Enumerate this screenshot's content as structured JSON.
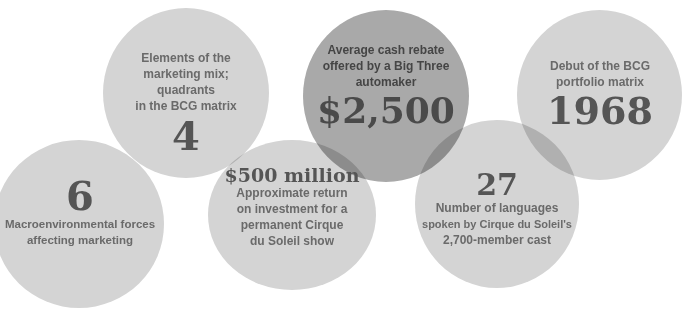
{
  "stats": [
    {
      "id": "four",
      "value": "4",
      "label_lines": [
        "Elements of the",
        "marketing mix; quadrants",
        "in the BCG matrix"
      ]
    },
    {
      "id": "six",
      "value": "6",
      "label_lines": [
        "Macroenvironmental forces",
        "affecting marketing"
      ]
    },
    {
      "id": "five-hundred-million",
      "value": "$500 million",
      "label_lines": [
        "Approximate return",
        "on investment for a",
        "permanent Cirque",
        "du Soleil show"
      ]
    },
    {
      "id": "cash-rebate",
      "value": "$2,500",
      "label_lines": [
        "Average cash rebate",
        "offered by a Big Three",
        "automaker"
      ]
    },
    {
      "id": "twenty-seven",
      "value": "27",
      "label_lines": [
        "Number of languages",
        "spoken by Cirque du Soleil's",
        "2,700-member cast"
      ]
    },
    {
      "id": "nineteen-sixty-eight",
      "value": "1968",
      "label_lines": [
        "Debut of the BCG",
        "portfolio matrix"
      ]
    }
  ],
  "colors": {
    "background": "#ffffff",
    "light_circle": "#d4d4d4",
    "dark_circle": "#a9a9a9",
    "number_text": "#555555",
    "label_text": "#6a6a6a"
  }
}
